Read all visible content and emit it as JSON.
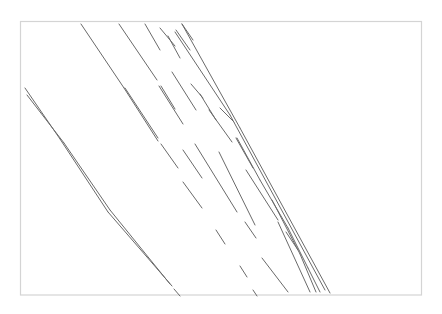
{
  "image": {
    "description": "Pencil sketch of diagonal parallel line strokes inside a thin rectangular frame",
    "background": "#ffffff",
    "frame": {
      "x": 20.5,
      "y": 21.5,
      "w": 401,
      "h": 273.5,
      "color": "#d4d4d4"
    },
    "stroke_color": "#6a6a6a",
    "strokes": [
      [
        81,
        24,
        124,
        88
      ],
      [
        124,
        88,
        158,
        141
      ],
      [
        119,
        24,
        157,
        80
      ],
      [
        161,
        86,
        175,
        109
      ],
      [
        145,
        24,
        160,
        50
      ],
      [
        160,
        28,
        175,
        46
      ],
      [
        168,
        36,
        180,
        58
      ],
      [
        176,
        30,
        190,
        50
      ],
      [
        182,
        24,
        193,
        40
      ],
      [
        182,
        24,
        240,
        128
      ],
      [
        240,
        128,
        330,
        293
      ],
      [
        175,
        32,
        230,
        115
      ],
      [
        230,
        115,
        325,
        290
      ],
      [
        172,
        72,
        196,
        110
      ],
      [
        191,
        84,
        203,
        98
      ],
      [
        200,
        94,
        216,
        120
      ],
      [
        209,
        110,
        232,
        142
      ],
      [
        220,
        108,
        234,
        122
      ],
      [
        236,
        138,
        253,
        168
      ],
      [
        237,
        138,
        260,
        180
      ],
      [
        246,
        170,
        278,
        220
      ],
      [
        260,
        180,
        288,
        228
      ],
      [
        272,
        200,
        300,
        254
      ],
      [
        286,
        232,
        298,
        250
      ],
      [
        288,
        228,
        308,
        268
      ],
      [
        300,
        254,
        316,
        292
      ],
      [
        308,
        268,
        320,
        292
      ],
      [
        262,
        258,
        288,
        292
      ],
      [
        278,
        222,
        310,
        292
      ],
      [
        125,
        88,
        158,
        138
      ],
      [
        159,
        86,
        183,
        124
      ],
      [
        161,
        144,
        178,
        168
      ],
      [
        183,
        150,
        202,
        178
      ],
      [
        195,
        144,
        237,
        212
      ],
      [
        219,
        152,
        255,
        225
      ],
      [
        183,
        182,
        202,
        208
      ],
      [
        216,
        230,
        225,
        244
      ],
      [
        240,
        266,
        247,
        277
      ],
      [
        253,
        290,
        257,
        296
      ],
      [
        245,
        222,
        256,
        238
      ],
      [
        25,
        88,
        60,
        139
      ],
      [
        60,
        139,
        108,
        212
      ],
      [
        108,
        212,
        172,
        286
      ],
      [
        27,
        95,
        64,
        143
      ],
      [
        64,
        143,
        110,
        210
      ],
      [
        110,
        210,
        170,
        284
      ],
      [
        174,
        289,
        180,
        296
      ]
    ]
  }
}
